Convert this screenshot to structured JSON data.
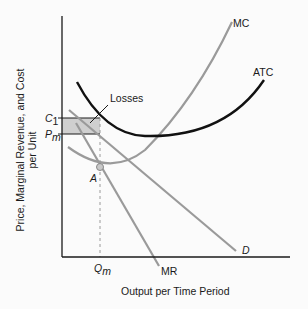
{
  "diagram": {
    "type": "economics-cost-curves",
    "axes": {
      "y_title_line1": "Price, Marginal Revenue, and Cost",
      "y_title_line2": "per Unit",
      "x_title": "Output per Time Period"
    },
    "curves": {
      "mc": "MC",
      "atc": "ATC",
      "demand": "D",
      "mr": "MR"
    },
    "annotations": {
      "losses": "Losses",
      "point_a": "A",
      "c1_main": "C",
      "c1_sub": "1",
      "pm_main": "P",
      "pm_sub": "m",
      "qm_main": "Q",
      "qm_sub": "m"
    },
    "colors": {
      "axis": "#1a1a1a",
      "atc": "#111111",
      "gray_curves": "#9a9a9a",
      "loss_fill": "#cfcfcf",
      "point_fill": "#c8c8c8"
    }
  }
}
